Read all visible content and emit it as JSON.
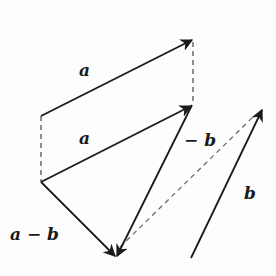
{
  "diagram": {
    "title": "",
    "stroke_color": "#1a1a1a",
    "dash_color": "#555555",
    "vectors": [
      {
        "id": "a-top",
        "label": "a",
        "from": [
          41,
          116
        ],
        "to": [
          193,
          39
        ],
        "style": "solid",
        "arrow": true
      },
      {
        "id": "a-lower",
        "label": "a",
        "from": [
          41,
          182
        ],
        "to": [
          192,
          105
        ],
        "style": "solid",
        "arrow": true
      },
      {
        "id": "neg-b",
        "label": "− b",
        "from": [
          192,
          105
        ],
        "to": [
          116,
          257
        ],
        "style": "solid",
        "arrow": true
      },
      {
        "id": "a-minus-b",
        "label": "a − b",
        "from": [
          41,
          182
        ],
        "to": [
          116,
          257
        ],
        "style": "solid",
        "arrow": true
      },
      {
        "id": "b",
        "label": "b",
        "from": [
          191,
          258
        ],
        "to": [
          263,
          108
        ],
        "style": "solid",
        "arrow": true
      }
    ],
    "guides": [
      {
        "id": "dash-left",
        "from": [
          41,
          116
        ],
        "to": [
          41,
          182
        ],
        "style": "dashed"
      },
      {
        "id": "dash-right",
        "from": [
          193,
          39
        ],
        "to": [
          193,
          105
        ],
        "style": "dashed"
      },
      {
        "id": "dash-diagonal",
        "from": [
          120,
          247
        ],
        "to": [
          253,
          117
        ],
        "style": "dashed"
      }
    ],
    "labels": {
      "a_top": "a",
      "a_lower": "a",
      "neg_b": "− b",
      "a_minus_b": "a − b",
      "b": "b"
    }
  }
}
